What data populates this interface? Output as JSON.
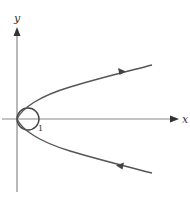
{
  "diagram": {
    "type": "phase-portrait",
    "axes": {
      "x_label": "x",
      "y_label": "y"
    },
    "circle_label": "1",
    "colors": {
      "axis": "#888888",
      "curve": "#555555",
      "text": "#333333"
    },
    "curves": [
      {
        "name": "upper-branch",
        "direction": "outward",
        "arrow": "right"
      },
      {
        "name": "lower-branch",
        "direction": "inward",
        "arrow": "left"
      },
      {
        "name": "unit-circle",
        "center": [
          0.5,
          0
        ],
        "radius": 0.5
      }
    ]
  }
}
